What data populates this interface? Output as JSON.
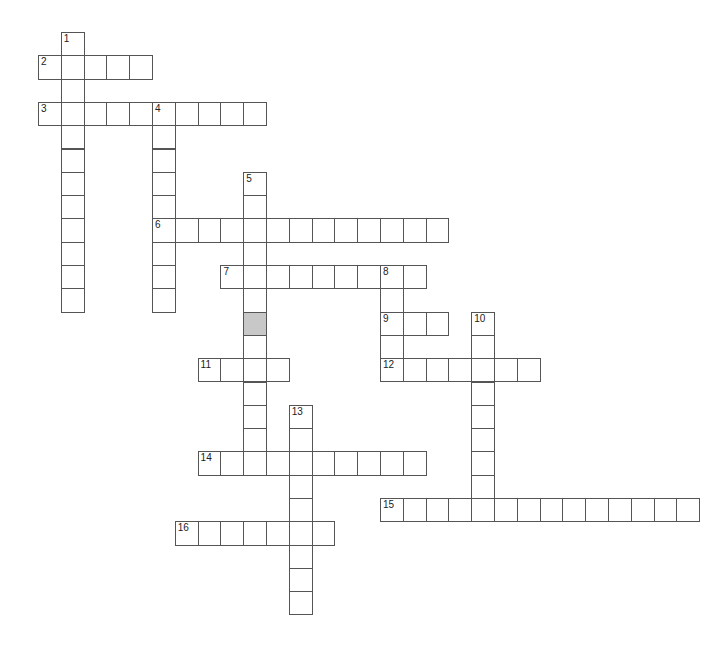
{
  "puzzle": {
    "title": "Crossword",
    "cell_width": 22.8,
    "cell_height": 23.3,
    "origin_x": 38,
    "origin_y": 32,
    "shaded_color": "#c8c8c8",
    "border_color": "#555555",
    "shaded_cells": [
      [
        12,
        9
      ]
    ],
    "words": [
      {
        "number": "1",
        "direction": "down",
        "row": 0,
        "col": 1,
        "length": 12
      },
      {
        "number": "2",
        "direction": "across",
        "row": 1,
        "col": 0,
        "length": 5
      },
      {
        "number": "3",
        "direction": "across",
        "row": 3,
        "col": 0,
        "length": 10
      },
      {
        "number": "4",
        "direction": "down",
        "row": 3,
        "col": 5,
        "length": 9
      },
      {
        "number": "5",
        "direction": "down",
        "row": 6,
        "col": 9,
        "length": 13
      },
      {
        "number": "6",
        "direction": "across",
        "row": 8,
        "col": 5,
        "length": 13
      },
      {
        "number": "7",
        "direction": "across",
        "row": 10,
        "col": 8,
        "length": 9
      },
      {
        "number": "8",
        "direction": "down",
        "row": 10,
        "col": 15,
        "length": 5
      },
      {
        "number": "9",
        "direction": "across",
        "row": 12,
        "col": 15,
        "length": 3
      },
      {
        "number": "10",
        "direction": "down",
        "row": 12,
        "col": 19,
        "length": 9
      },
      {
        "number": "11",
        "direction": "across",
        "row": 14,
        "col": 7,
        "length": 4
      },
      {
        "number": "12",
        "direction": "across",
        "row": 14,
        "col": 15,
        "length": 7
      },
      {
        "number": "13",
        "direction": "down",
        "row": 16,
        "col": 11,
        "length": 9
      },
      {
        "number": "14",
        "direction": "across",
        "row": 18,
        "col": 7,
        "length": 10
      },
      {
        "number": "15",
        "direction": "across",
        "row": 20,
        "col": 15,
        "length": 14
      },
      {
        "number": "16",
        "direction": "across",
        "row": 21,
        "col": 6,
        "length": 7
      }
    ]
  }
}
